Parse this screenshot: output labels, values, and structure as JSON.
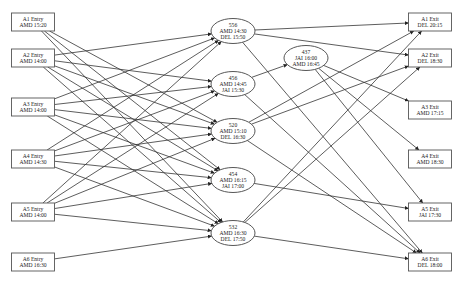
{
  "diagram": {
    "type": "flight-connection-network",
    "entries": [
      {
        "id": "A1E",
        "line1": "A1 Entry",
        "line2": "AMD 15:20",
        "x": 33,
        "y": 22
      },
      {
        "id": "A2E",
        "line1": "A2 Entry",
        "line2": "AMD 14:00",
        "x": 33,
        "y": 58
      },
      {
        "id": "A3E",
        "line1": "A3 Entry",
        "line2": "AMD 14:00",
        "x": 33,
        "y": 107
      },
      {
        "id": "A4E",
        "line1": "A4 Entry",
        "line2": "AMD 14:30",
        "x": 33,
        "y": 159
      },
      {
        "id": "A5E",
        "line1": "A5 Entry",
        "line2": "AMD 14:00",
        "x": 33,
        "y": 212
      },
      {
        "id": "A6E",
        "line1": "A6 Entry",
        "line2": "AMD 16:30",
        "x": 33,
        "y": 262
      }
    ],
    "flights": [
      {
        "id": "F556",
        "line1": "556",
        "line2": "AMD 14:30",
        "line3": "DEL 15:50",
        "x": 233,
        "y": 31
      },
      {
        "id": "F456",
        "line1": "456",
        "line2": "AMD 14:45",
        "line3": "JAI 15:30",
        "x": 233,
        "y": 84
      },
      {
        "id": "F520",
        "line1": "520",
        "line2": "AMD 15:10",
        "line3": "DEL 16:30",
        "x": 233,
        "y": 131
      },
      {
        "id": "F454",
        "line1": "454",
        "line2": "AMD 16:15",
        "line3": "JAI 17:00",
        "x": 233,
        "y": 180
      },
      {
        "id": "F532",
        "line1": "532",
        "line2": "AMD 16:30",
        "line3": "DEL 17:50",
        "x": 233,
        "y": 233
      },
      {
        "id": "F437",
        "line1": "437",
        "line2": "JAI 16:00",
        "line3": "AMD 16:45",
        "x": 306,
        "y": 58
      }
    ],
    "exits": [
      {
        "id": "A1X",
        "line1": "A1 Exit",
        "line2": "DEL 20:15",
        "x": 430,
        "y": 22
      },
      {
        "id": "A2X",
        "line1": "A2 Exit",
        "line2": "DEL 18:30",
        "x": 430,
        "y": 58
      },
      {
        "id": "A3X",
        "line1": "A3 Exit",
        "line2": "AMD 17:15",
        "x": 430,
        "y": 110
      },
      {
        "id": "A4X",
        "line1": "A4 Exit",
        "line2": "AMD 18:30",
        "x": 430,
        "y": 159
      },
      {
        "id": "A5X",
        "line1": "A5 Exit",
        "line2": "JAI 17:30",
        "x": 430,
        "y": 212
      },
      {
        "id": "A6X",
        "line1": "A6 Exit",
        "line2": "DEL 18:00",
        "x": 430,
        "y": 262
      }
    ],
    "edges": [
      [
        "A1E",
        "F520"
      ],
      [
        "A1E",
        "F454"
      ],
      [
        "A1E",
        "F532"
      ],
      [
        "A2E",
        "F556"
      ],
      [
        "A2E",
        "F456"
      ],
      [
        "A2E",
        "F520"
      ],
      [
        "A2E",
        "F454"
      ],
      [
        "A2E",
        "F532"
      ],
      [
        "A3E",
        "F556"
      ],
      [
        "A3E",
        "F456"
      ],
      [
        "A3E",
        "F520"
      ],
      [
        "A3E",
        "F454"
      ],
      [
        "A3E",
        "F532"
      ],
      [
        "A4E",
        "F556"
      ],
      [
        "A4E",
        "F456"
      ],
      [
        "A4E",
        "F520"
      ],
      [
        "A4E",
        "F454"
      ],
      [
        "A4E",
        "F532"
      ],
      [
        "A5E",
        "F556"
      ],
      [
        "A5E",
        "F456"
      ],
      [
        "A5E",
        "F520"
      ],
      [
        "A5E",
        "F454"
      ],
      [
        "A5E",
        "F532"
      ],
      [
        "A6E",
        "F532"
      ],
      [
        "F456",
        "F437"
      ],
      [
        "F556",
        "A1X"
      ],
      [
        "F556",
        "A2X"
      ],
      [
        "F556",
        "A6X"
      ],
      [
        "F456",
        "A6X"
      ],
      [
        "F437",
        "A3X"
      ],
      [
        "F437",
        "A4X"
      ],
      [
        "F437",
        "A5X"
      ],
      [
        "F520",
        "A1X"
      ],
      [
        "F520",
        "A2X"
      ],
      [
        "F520",
        "A6X"
      ],
      [
        "F454",
        "A5X"
      ],
      [
        "F532",
        "A1X"
      ],
      [
        "F532",
        "A2X"
      ],
      [
        "F532",
        "A6X"
      ]
    ]
  },
  "geometry": {
    "box_w": 43,
    "box_h": 18,
    "ell_rx": 22,
    "ell_ry": 12.5,
    "colors": {
      "stroke": "#333333",
      "fill": "#ffffff",
      "text": "#222222"
    }
  }
}
